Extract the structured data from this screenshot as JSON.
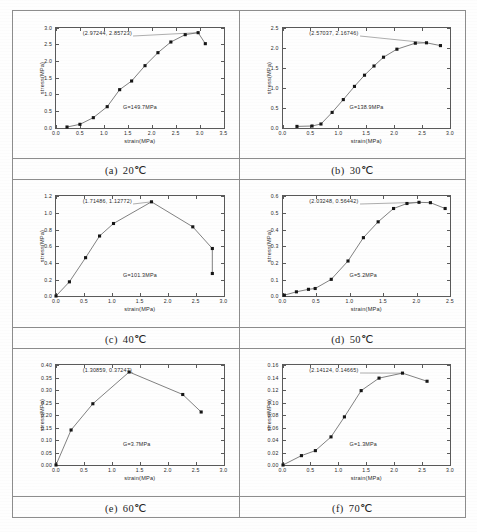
{
  "figure": {
    "layout": "2-column table of six stress-strain plots with captions",
    "rows": 3,
    "cols": 2
  },
  "captions": [
    {
      "label": "(a)",
      "text": "20℃"
    },
    {
      "label": "(b)",
      "text": "30℃"
    },
    {
      "label": "(c)",
      "text": "40℃"
    },
    {
      "label": "(d)",
      "text": "50℃"
    },
    {
      "label": "(e)",
      "text": "60℃"
    },
    {
      "label": "(f)",
      "text": "70℃"
    }
  ],
  "chart_data": [
    {
      "id": "a",
      "type": "line",
      "title": "(a) 20℃",
      "xlabel": "strain(MPa)",
      "ylabel": "stress(MPa)",
      "xlim": [
        0.0,
        3.5
      ],
      "ylim": [
        0.0,
        3.0
      ],
      "xticks": [
        "0.0",
        "0.5",
        "1.0",
        "1.5",
        "2.0",
        "2.5",
        "3.0",
        "3.5"
      ],
      "yticks": [
        "0.0",
        "0.5",
        "1.0",
        "1.5",
        "2.0",
        "2.5",
        "3.0"
      ],
      "grid": false,
      "annotation": "(2.97244,  2.85723)",
      "modulus_label": "G=149.7MPa",
      "marker": "filled-square",
      "x": [
        0.23,
        0.5,
        0.78,
        1.07,
        1.33,
        1.58,
        1.86,
        2.13,
        2.4,
        2.7,
        2.97,
        3.12
      ],
      "y": [
        0.03,
        0.11,
        0.31,
        0.64,
        1.15,
        1.41,
        1.87,
        2.26,
        2.58,
        2.8,
        2.86,
        2.53
      ]
    },
    {
      "id": "b",
      "type": "line",
      "title": "(b) 30℃",
      "xlabel": "strain(MPa)",
      "ylabel": "stress(MPa)",
      "xlim": [
        0.0,
        3.0
      ],
      "ylim": [
        0.0,
        2.5
      ],
      "xticks": [
        "0.0",
        "0.5",
        "1.0",
        "1.5",
        "2.0",
        "2.5",
        "3.0"
      ],
      "yticks": [
        "0.0",
        "0.5",
        "1.0",
        "1.5",
        "2.0",
        "2.5"
      ],
      "grid": false,
      "annotation": "(2.57037,  2.16746)",
      "modulus_label": "G=138.9MPa",
      "marker": "filled-square",
      "x": [
        0.25,
        0.52,
        0.68,
        0.88,
        1.08,
        1.28,
        1.46,
        1.63,
        1.8,
        2.04,
        2.37,
        2.57,
        2.82
      ],
      "y": [
        0.04,
        0.05,
        0.1,
        0.39,
        0.71,
        1.04,
        1.32,
        1.55,
        1.77,
        1.97,
        2.12,
        2.13,
        2.06
      ]
    },
    {
      "id": "c",
      "type": "line",
      "title": "(c) 40℃",
      "xlabel": "strain(MPa)",
      "ylabel": "stress(MPa)",
      "xlim": [
        0.0,
        3.0
      ],
      "ylim": [
        0.0,
        1.2
      ],
      "xticks": [
        "0.0",
        "0.5",
        "1.0",
        "1.5",
        "2.0",
        "2.5",
        "3.0"
      ],
      "yticks": [
        "0.0",
        "0.2",
        "0.4",
        "0.6",
        "0.8",
        "1.0",
        "1.2"
      ],
      "grid": false,
      "annotation": "(1.71486,  1.12772)",
      "modulus_label": "G=101.3MPa",
      "marker": "filled-square",
      "x": [
        0.0,
        0.24,
        0.53,
        0.78,
        1.03,
        1.71,
        2.45,
        2.8,
        2.8
      ],
      "y": [
        0.0,
        0.17,
        0.46,
        0.72,
        0.87,
        1.13,
        0.83,
        0.57,
        0.27
      ]
    },
    {
      "id": "d",
      "type": "line",
      "title": "(d) 50℃",
      "xlabel": "strain(MPa)",
      "ylabel": "stress(MPa)",
      "xlim": [
        0.0,
        2.5
      ],
      "ylim": [
        0.0,
        0.6
      ],
      "xticks": [
        "0.0",
        "0.5",
        "1.0",
        "1.5",
        "2.0",
        "2.5"
      ],
      "yticks": [
        "0.0",
        "0.1",
        "0.2",
        "0.3",
        "0.4",
        "0.5",
        "0.6"
      ],
      "grid": false,
      "annotation": "(2.03248,  0.56442)",
      "modulus_label": "G=5.2MPa",
      "marker": "filled-square",
      "x": [
        0.02,
        0.2,
        0.38,
        0.48,
        0.72,
        0.97,
        1.2,
        1.42,
        1.65,
        1.85,
        2.03,
        2.2,
        2.42
      ],
      "y": [
        0.005,
        0.025,
        0.04,
        0.045,
        0.1,
        0.21,
        0.35,
        0.445,
        0.525,
        0.555,
        0.562,
        0.56,
        0.525
      ]
    },
    {
      "id": "e",
      "type": "line",
      "title": "(e) 60℃",
      "xlabel": "strain(MPa)",
      "ylabel": "stress(MPa)",
      "xlim": [
        0.0,
        3.0
      ],
      "ylim": [
        0.0,
        0.4
      ],
      "xticks": [
        "0.0",
        "0.5",
        "1.0",
        "1.5",
        "2.0",
        "2.5",
        "3.0"
      ],
      "yticks": [
        "0.00",
        "0.05",
        "0.10",
        "0.15",
        "0.20",
        "0.25",
        "0.30",
        "0.35",
        "0.40"
      ],
      "grid": false,
      "annotation": "(1.30859,  0.37247)",
      "modulus_label": "G=3.7MPa",
      "marker": "filled-square",
      "x": [
        0.0,
        0.27,
        0.66,
        1.31,
        2.27,
        2.6
      ],
      "y": [
        0.0,
        0.14,
        0.245,
        0.372,
        0.282,
        0.212
      ]
    },
    {
      "id": "f",
      "type": "line",
      "title": "(f) 70℃",
      "xlabel": "strain(MPa)",
      "ylabel": "stress(MPa)",
      "xlim": [
        0.0,
        3.0
      ],
      "ylim": [
        0.0,
        0.16
      ],
      "xticks": [
        "0.0",
        "0.5",
        "1.0",
        "1.5",
        "2.0",
        "2.5",
        "3.0"
      ],
      "yticks": [
        "0.00",
        "0.02",
        "0.04",
        "0.06",
        "0.08",
        "0.10",
        "0.12",
        "0.14",
        "0.16"
      ],
      "grid": false,
      "annotation": "(2.14124,  0.14665)",
      "modulus_label": "G=1.3MPa",
      "marker": "filled-square",
      "x": [
        0.0,
        0.33,
        0.58,
        0.86,
        1.1,
        1.4,
        1.72,
        2.14,
        2.58
      ],
      "y": [
        0.0,
        0.015,
        0.023,
        0.045,
        0.077,
        0.119,
        0.139,
        0.147,
        0.134
      ]
    }
  ]
}
